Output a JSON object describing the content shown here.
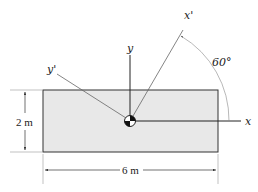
{
  "diagram": {
    "type": "rotated-axes-rectangle-section",
    "rectangle": {
      "width_label": "6 m",
      "height_label": "2 m",
      "fill": "#e8e8e8",
      "stroke": "#333333"
    },
    "axes": {
      "x_label": "x",
      "y_label": "y",
      "x_prime_label": "x'",
      "y_prime_label": "y'"
    },
    "angle": {
      "label": "60°",
      "value_deg": 60,
      "from_axis": "x",
      "to_axis": "x'"
    },
    "centroid_symbol": "centroid-marker"
  }
}
